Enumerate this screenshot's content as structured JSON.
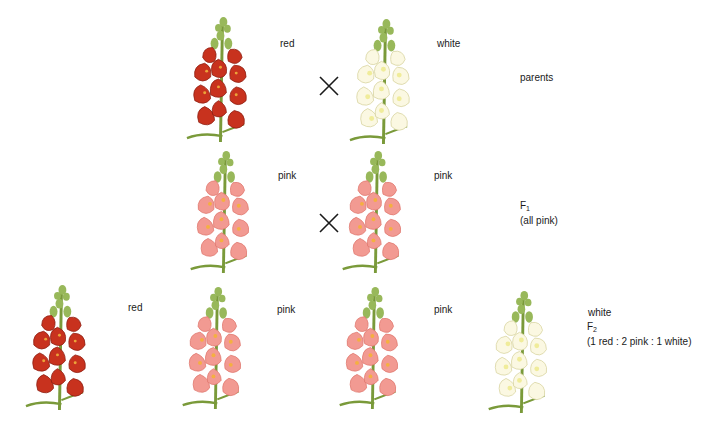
{
  "diagram": {
    "colors": {
      "red": "#c8321e",
      "red_dark": "#8e1f12",
      "pink": "#f29a92",
      "pink_dark": "#e0786f",
      "white": "#fbf8e2",
      "white_shade": "#f0ec9a",
      "stem": "#7a9a3a",
      "bud": "#98b85a",
      "throat": "#f4c040",
      "cross": "#1a1a1a"
    },
    "rows": [
      {
        "id": "parents",
        "generation_label": "parents",
        "generation_sub": "",
        "note": "",
        "plants": [
          {
            "color": "red",
            "label": "red"
          },
          {
            "color": "white",
            "label": "white"
          }
        ],
        "cross_symbol": "×"
      },
      {
        "id": "f1",
        "generation_label": "F",
        "generation_sub": "1",
        "note": "(all pink)",
        "plants": [
          {
            "color": "pink",
            "label": "pink"
          },
          {
            "color": "pink",
            "label": "pink"
          }
        ],
        "cross_symbol": "×"
      },
      {
        "id": "f2",
        "generation_label": "F",
        "generation_sub": "2",
        "note": "(1 red : 2 pink : 1 white)",
        "plants": [
          {
            "color": "red",
            "label": "red"
          },
          {
            "color": "pink",
            "label": "pink"
          },
          {
            "color": "pink",
            "label": "pink"
          },
          {
            "color": "white",
            "label": "white"
          }
        ]
      }
    ]
  }
}
